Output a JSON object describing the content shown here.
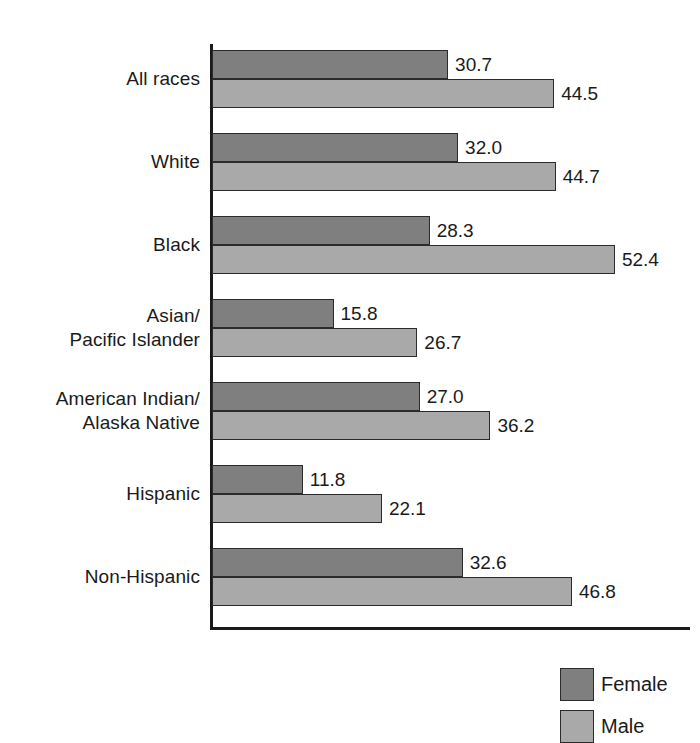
{
  "chart_data": {
    "type": "bar",
    "orientation": "horizontal",
    "title": "",
    "subtitle": "",
    "xlabel": "",
    "ylabel": "",
    "grid": false,
    "xlim": [
      0,
      62
    ],
    "axis_origin_value": 0,
    "legend_position": "bottom-right",
    "categories": [
      "All races",
      "White",
      "Black",
      "Asian/\nPacific Islander",
      "American Indian/\nAlaska Native",
      "Hispanic",
      "Non-Hispanic"
    ],
    "series": [
      {
        "name": "Female",
        "color": "#7f7f7f",
        "values": [
          30.7,
          32.0,
          28.3,
          15.8,
          27.0,
          11.8,
          32.6
        ]
      },
      {
        "name": "Male",
        "color": "#a9a9a9",
        "values": [
          44.5,
          44.7,
          52.4,
          26.7,
          36.2,
          22.1,
          46.8
        ]
      }
    ]
  },
  "groups": [
    {
      "label_lines": [
        "All races"
      ],
      "female": {
        "value": 30.7,
        "label": "30.7"
      },
      "male": {
        "value": 44.5,
        "label": "44.5"
      }
    },
    {
      "label_lines": [
        "White"
      ],
      "female": {
        "value": 32.0,
        "label": "32.0"
      },
      "male": {
        "value": 44.7,
        "label": "44.7"
      }
    },
    {
      "label_lines": [
        "Black"
      ],
      "female": {
        "value": 28.3,
        "label": "28.3"
      },
      "male": {
        "value": 52.4,
        "label": "52.4"
      }
    },
    {
      "label_lines": [
        "Asian/",
        "Pacific Islander"
      ],
      "female": {
        "value": 15.8,
        "label": "15.8"
      },
      "male": {
        "value": 26.7,
        "label": "26.7"
      }
    },
    {
      "label_lines": [
        "American Indian/",
        "Alaska Native"
      ],
      "female": {
        "value": 27.0,
        "label": "27.0"
      },
      "male": {
        "value": 36.2,
        "label": "36.2"
      }
    },
    {
      "label_lines": [
        "Hispanic"
      ],
      "female": {
        "value": 11.8,
        "label": "11.8"
      },
      "male": {
        "value": 22.1,
        "label": "22.1"
      }
    },
    {
      "label_lines": [
        "Non-Hispanic"
      ],
      "female": {
        "value": 32.6,
        "label": "32.6"
      },
      "male": {
        "value": 46.8,
        "label": "46.8"
      }
    }
  ],
  "legend": {
    "items": [
      {
        "label": "Female",
        "color": "#7f7f7f",
        "swatch": "female"
      },
      {
        "label": "Male",
        "color": "#a9a9a9",
        "swatch": "male"
      }
    ]
  },
  "layout": {
    "axis_left_px": 212,
    "px_per_unit": 7.69,
    "first_group_top_px": 50,
    "group_pitch_px": 83,
    "bar_height_px": 29
  }
}
